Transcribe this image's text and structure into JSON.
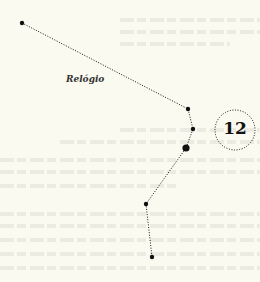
{
  "diagram": {
    "label": "Relógio",
    "badge_number": "12",
    "colors": {
      "background": "#fbfaf0",
      "ink": "#111111",
      "bleed_through": "#ecebe2"
    },
    "points": [
      {
        "x": 22,
        "y": 23,
        "r": 2.2
      },
      {
        "x": 188,
        "y": 109,
        "r": 2.2
      },
      {
        "x": 193,
        "y": 129,
        "r": 2.2
      },
      {
        "x": 186,
        "y": 148,
        "r": 3.6
      },
      {
        "x": 146,
        "y": 204,
        "r": 2.2
      },
      {
        "x": 152,
        "y": 257,
        "r": 2.2
      }
    ],
    "badge": {
      "cx": 235,
      "cy": 130,
      "r": 20
    }
  }
}
